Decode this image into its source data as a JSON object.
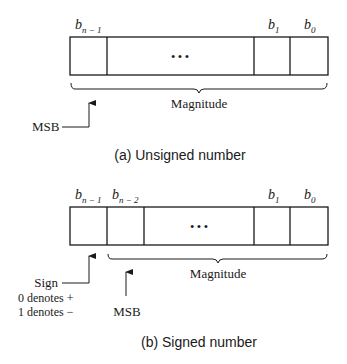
{
  "figure_a": {
    "bit_labels": {
      "msb_bit": {
        "base": "b",
        "sub": "n − 1"
      },
      "b1": {
        "base": "b",
        "sub": "1"
      },
      "b0": {
        "base": "b",
        "sub": "0"
      }
    },
    "ellipsis": "• • •",
    "brace_label": "Magnitude",
    "arrow_label": "MSB",
    "caption": "(a) Unsigned number"
  },
  "figure_b": {
    "bit_labels": {
      "sign_bit": {
        "base": "b",
        "sub": "n − 1"
      },
      "msb_bit": {
        "base": "b",
        "sub": "n − 2"
      },
      "b1": {
        "base": "b",
        "sub": "1"
      },
      "b0": {
        "base": "b",
        "sub": "0"
      }
    },
    "ellipsis": "• • •",
    "brace_label": "Magnitude",
    "sign_label": "Sign",
    "sign_note_1": "0 denotes +",
    "sign_note_2": "1 denotes −",
    "arrow_label": "MSB",
    "caption": "(b) Signed number"
  }
}
